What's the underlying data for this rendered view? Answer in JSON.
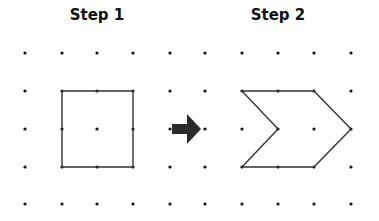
{
  "titles": {
    "step1": "Step 1",
    "step2": "Step 2"
  },
  "grid": {
    "xs": [
      25,
      62,
      97,
      133,
      170,
      205,
      242,
      278,
      314,
      351
    ],
    "ys": [
      53,
      91,
      129,
      167,
      204
    ],
    "dot_radius": 1.6,
    "dot_color": "#111111"
  },
  "shapes": {
    "step1_square": {
      "points": "62,91 133,91 133,167 62,167",
      "stroke": "#333333"
    },
    "step2_chevron": {
      "points": "242,91 314,91 351,129 314,167 242,167 278,129",
      "stroke": "#333333"
    }
  },
  "arrow": {
    "color": "#2b2b2b",
    "points": "172,124 187,124 187,114 201,129 187,144 187,134 172,134"
  }
}
